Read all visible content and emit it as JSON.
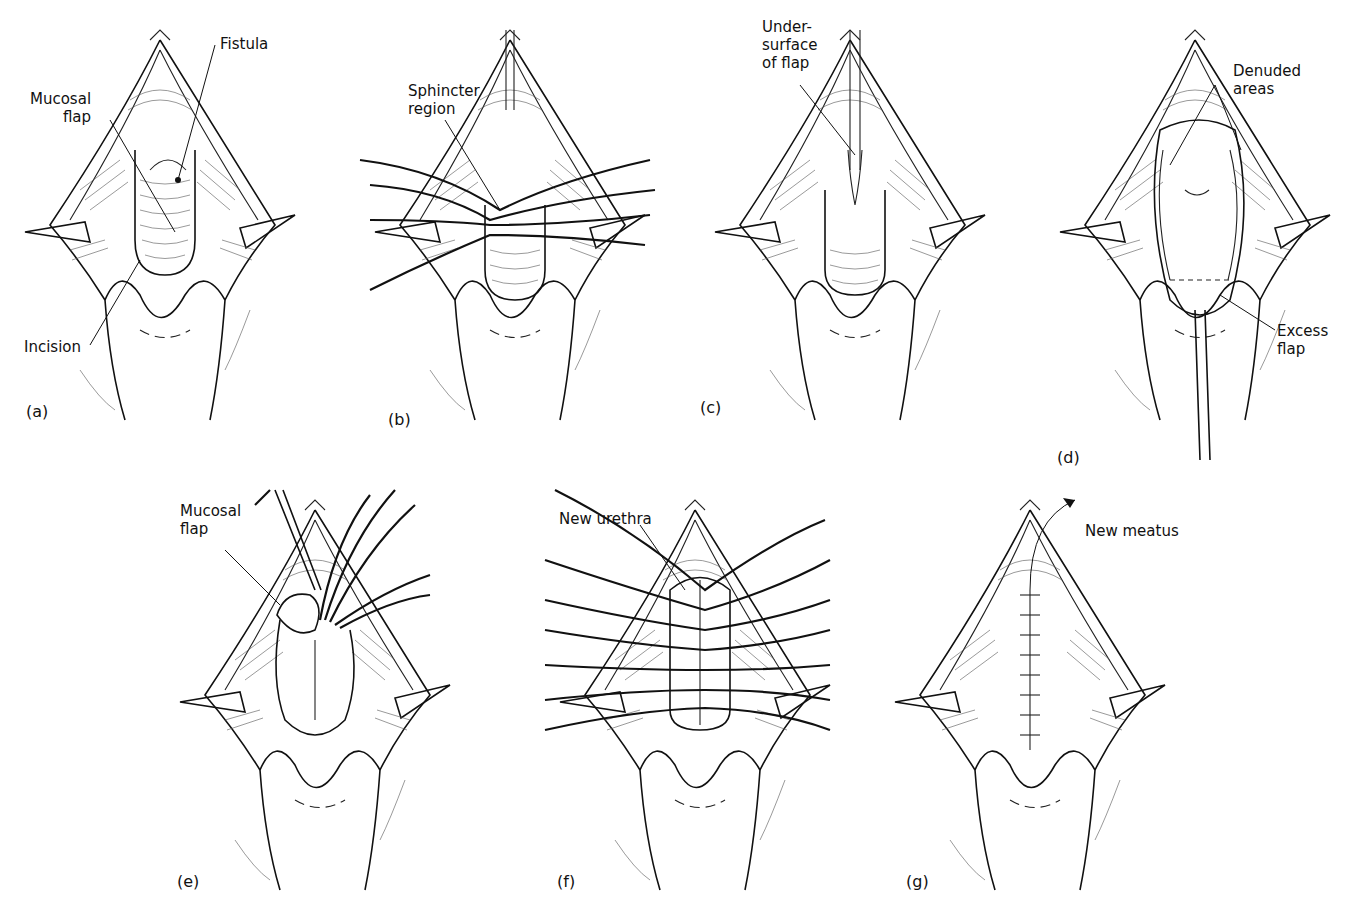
{
  "figure": {
    "panels": [
      {
        "id": "a",
        "tag": "(a)",
        "labels": [
          "Fistula",
          "Mucosal\nflap",
          "Incision"
        ]
      },
      {
        "id": "b",
        "tag": "(b)",
        "labels": [
          "Sphincter\nregion"
        ]
      },
      {
        "id": "c",
        "tag": "(c)",
        "labels": [
          "Under-\nsurface\nof flap"
        ]
      },
      {
        "id": "d",
        "tag": "(d)",
        "labels": [
          "Denuded\nareas",
          "Excess\nflap"
        ]
      },
      {
        "id": "e",
        "tag": "(e)",
        "labels": [
          "Mucosal\nflap"
        ]
      },
      {
        "id": "f",
        "tag": "(f)",
        "labels": [
          "New urethra"
        ]
      },
      {
        "id": "g",
        "tag": "(g)",
        "labels": [
          "New meatus"
        ]
      }
    ]
  }
}
